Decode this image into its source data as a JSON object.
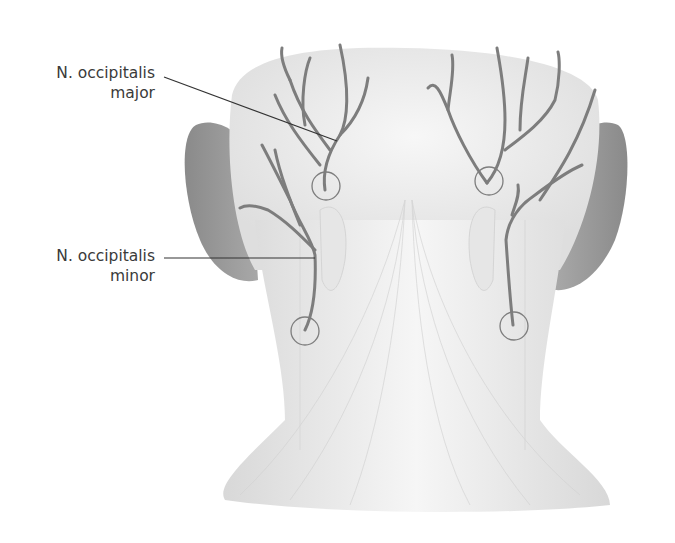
{
  "figure": {
    "labels": [
      {
        "line1": "N. occipitalis",
        "line2": "major"
      },
      {
        "line1": "N. occipitalis",
        "line2": "minor"
      }
    ]
  },
  "colors": {
    "nerve": "#7d7d7d",
    "ear": "#8f8f8f",
    "skin": "#efefef",
    "muscle": "#e4e4e4",
    "leader": "#333333",
    "text": "#3a3a3a"
  }
}
